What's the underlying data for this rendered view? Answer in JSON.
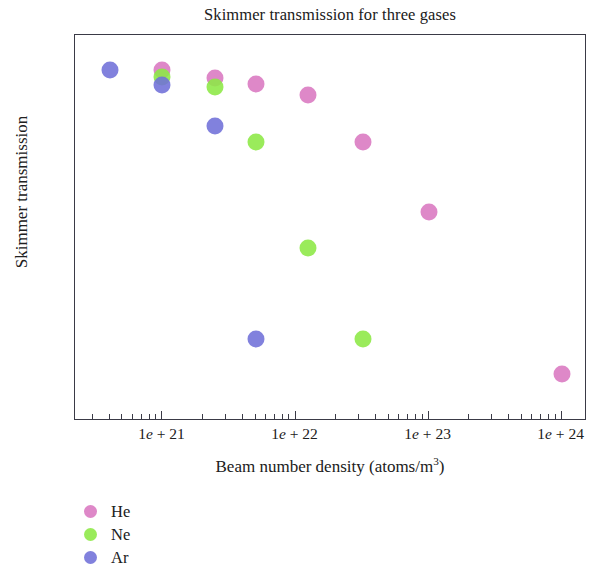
{
  "chart_data": {
    "type": "scatter",
    "title": "Skimmer transmission for three gases",
    "xlabel": "Beam number density (atoms/m",
    "xlabel_superscript": "3",
    "xlabel_suffix": ")",
    "ylabel": "Skimmer transmission",
    "xscale": "log",
    "yscale": "log",
    "xlim": [
      2.2e+20,
      1.55e+24
    ],
    "ylim": [
      0.0058,
      0.43
    ],
    "grid": false,
    "legend_position": "below-left",
    "xticks": [
      {
        "value": 1e+21,
        "label_prefix": "1",
        "label_e": "e",
        "label_suffix": " + 21"
      },
      {
        "value": 1e+22,
        "label_prefix": "1",
        "label_e": "e",
        "label_suffix": " + 22"
      },
      {
        "value": 1e+23,
        "label_prefix": "1",
        "label_e": "e",
        "label_suffix": " + 23"
      },
      {
        "value": 1e+24,
        "label_prefix": "1",
        "label_e": "e",
        "label_suffix": " + 24"
      }
    ],
    "yticks": [
      {
        "value": 0.1,
        "label": "0.1"
      },
      {
        "value": 0.01,
        "label": "0.01"
      }
    ],
    "series": [
      {
        "name": "He",
        "color": "#d977c0",
        "points": [
          {
            "x": 1e+21,
            "y": 0.29
          },
          {
            "x": 2.5e+21,
            "y": 0.265
          },
          {
            "x": 5e+21,
            "y": 0.25
          },
          {
            "x": 1.25e+22,
            "y": 0.22
          },
          {
            "x": 3.2e+22,
            "y": 0.13
          },
          {
            "x": 1e+23,
            "y": 0.06
          },
          {
            "x": 1e+24,
            "y": 0.0098
          }
        ]
      },
      {
        "name": "Ne",
        "color": "#8ce844",
        "points": [
          {
            "x": 1e+21,
            "y": 0.27
          },
          {
            "x": 2.5e+21,
            "y": 0.24
          },
          {
            "x": 5e+21,
            "y": 0.13
          },
          {
            "x": 1.25e+22,
            "y": 0.04
          },
          {
            "x": 3.2e+22,
            "y": 0.0145
          }
        ]
      },
      {
        "name": "Ar",
        "color": "#6f6fd8",
        "points": [
          {
            "x": 4e+20,
            "y": 0.29
          },
          {
            "x": 1e+21,
            "y": 0.245
          },
          {
            "x": 2.5e+21,
            "y": 0.155
          },
          {
            "x": 5e+21,
            "y": 0.0145
          }
        ]
      }
    ]
  },
  "legend": {
    "items": [
      {
        "label": "He",
        "color": "#d977c0"
      },
      {
        "label": "Ne",
        "color": "#8ce844"
      },
      {
        "label": "Ar",
        "color": "#6f6fd8"
      }
    ]
  }
}
